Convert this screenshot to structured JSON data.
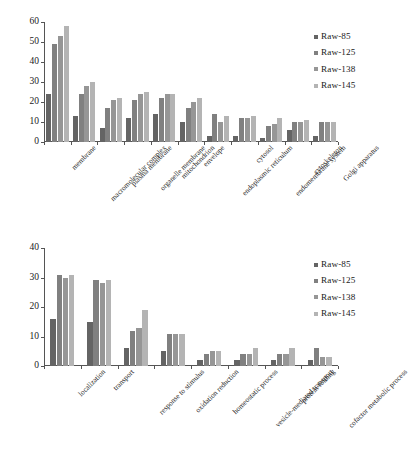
{
  "series_names": [
    "Raw-85",
    "Raw-125",
    "Raw-138",
    "Raw-145"
  ],
  "series_colors": [
    "#646464",
    "#808080",
    "#969696",
    "#b4b4b4"
  ],
  "legend": {
    "items": [
      {
        "label": "Raw-85",
        "color": "#646464"
      },
      {
        "label": "Raw-125",
        "color": "#808080"
      },
      {
        "label": "Raw-138",
        "color": "#969696"
      },
      {
        "label": "Raw-145",
        "color": "#b4b4b4"
      }
    ]
  },
  "chart_data": [
    {
      "type": "bar",
      "title": "",
      "xlabel": "",
      "ylabel": "",
      "ylim": [
        0,
        60
      ],
      "yticks": [
        0,
        10,
        20,
        30,
        40,
        50,
        60
      ],
      "grid": false,
      "legend_position": "right",
      "categories": [
        "membrane",
        "macromolecular complex",
        "plasma membrane",
        "organelle membrane",
        "mitochondrion",
        "envelope",
        "endoplasmic reticulum",
        "cytosol",
        "endomembrane system",
        "cytoskeleton",
        "Golgi apparatus"
      ],
      "series": [
        {
          "name": "Raw-85",
          "values": [
            24,
            13,
            7,
            12,
            14,
            10,
            3,
            3,
            2,
            6,
            3
          ]
        },
        {
          "name": "Raw-125",
          "values": [
            49,
            24,
            17,
            21,
            22,
            17,
            14,
            12,
            8,
            10,
            10
          ]
        },
        {
          "name": "Raw-138",
          "values": [
            53,
            28,
            21,
            24,
            24,
            20,
            10,
            12,
            9,
            10,
            10
          ]
        },
        {
          "name": "Raw-145",
          "values": [
            58,
            30,
            22,
            25,
            24,
            22,
            13,
            13,
            12,
            11,
            10
          ]
        }
      ]
    },
    {
      "type": "bar",
      "title": "",
      "xlabel": "",
      "ylabel": "",
      "ylim": [
        0,
        40
      ],
      "yticks": [
        0,
        10,
        20,
        30,
        40
      ],
      "grid": false,
      "legend_position": "right",
      "categories": [
        "localization",
        "transport",
        "response to stimulus",
        "oxidation reduction",
        "homeostatic process",
        "vesicle-mediated transport",
        "protein folding",
        "cofactor metabolic process"
      ],
      "series": [
        {
          "name": "Raw-85",
          "values": [
            16,
            15,
            6,
            5,
            2,
            2,
            2,
            2
          ]
        },
        {
          "name": "Raw-125",
          "values": [
            31,
            29,
            12,
            11,
            4,
            4,
            4,
            6
          ]
        },
        {
          "name": "Raw-138",
          "values": [
            30,
            28,
            13,
            11,
            5,
            4,
            4,
            3
          ]
        },
        {
          "name": "Raw-145",
          "values": [
            31,
            29,
            19,
            11,
            5,
            6,
            6,
            3
          ]
        }
      ]
    }
  ]
}
